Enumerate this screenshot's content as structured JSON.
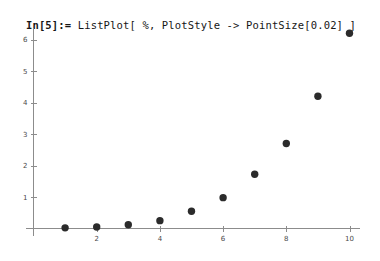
{
  "notebook": {
    "prompt_label": "In[5]:=",
    "expression": " ListPlot[ %, PlotStyle -> PointSize[0.02] ]",
    "full_line": "In[5]:= ListPlot[ %, PlotStyle -> PointSize[0.02] ]"
  },
  "chart_data": {
    "type": "scatter",
    "title": "",
    "xlabel": "",
    "ylabel": "",
    "x": [
      1,
      2,
      3,
      4,
      5,
      6,
      7,
      8,
      9,
      10
    ],
    "values": [
      0.02,
      0.05,
      0.12,
      0.25,
      0.55,
      0.98,
      1.72,
      2.7,
      4.2,
      6.2
    ],
    "series": [
      {
        "name": "data",
        "points": [
          {
            "x": 1,
            "y": 0.02
          },
          {
            "x": 2,
            "y": 0.05
          },
          {
            "x": 3,
            "y": 0.12
          },
          {
            "x": 4,
            "y": 0.25
          },
          {
            "x": 5,
            "y": 0.55
          },
          {
            "x": 6,
            "y": 0.98
          },
          {
            "x": 7,
            "y": 1.72
          },
          {
            "x": 8,
            "y": 2.7
          },
          {
            "x": 9,
            "y": 4.2
          },
          {
            "x": 10,
            "y": 6.2
          }
        ]
      }
    ],
    "xlim": [
      0,
      10.4
    ],
    "ylim": [
      0,
      6.45
    ],
    "xticks": [
      2,
      4,
      6,
      8,
      10
    ],
    "xtick_labels": [
      "2",
      "4",
      "6",
      "8",
      "10"
    ],
    "yticks": [
      1,
      2,
      3,
      4,
      5,
      6
    ],
    "ytick_labels": [
      "1",
      "2",
      "3",
      "4",
      "5",
      "6"
    ],
    "grid": false,
    "legend": false,
    "point_size": 0.02,
    "point_color": "#2b2b2b",
    "axis_color": "#8c8c8c"
  }
}
